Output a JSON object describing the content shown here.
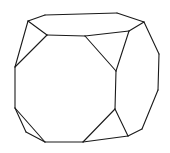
{
  "figure": {
    "stroke_color": "#1a1a1a",
    "stroke_width": 1.1,
    "background": "#ffffff",
    "vertices": {
      "A": [
        45,
        15
      ],
      "B": [
        117,
        13
      ],
      "C": [
        144,
        22
      ],
      "D": [
        28,
        21
      ],
      "E": [
        47,
        35
      ],
      "F": [
        85,
        36
      ],
      "G": [
        129,
        31
      ],
      "H": [
        15,
        67
      ],
      "I": [
        116,
        71
      ],
      "J": [
        159,
        54
      ],
      "K": [
        15,
        108
      ],
      "L": [
        115,
        109
      ],
      "M": [
        158,
        90
      ],
      "N": [
        26,
        132
      ],
      "O": [
        45,
        142
      ],
      "P": [
        83,
        142
      ],
      "Q": [
        128,
        136
      ],
      "R": [
        142,
        129
      ]
    },
    "edges": [
      [
        "D",
        "A"
      ],
      [
        "A",
        "B"
      ],
      [
        "B",
        "C"
      ],
      [
        "D",
        "E"
      ],
      [
        "E",
        "F"
      ],
      [
        "F",
        "G"
      ],
      [
        "G",
        "C"
      ],
      [
        "D",
        "H"
      ],
      [
        "E",
        "H"
      ],
      [
        "F",
        "I"
      ],
      [
        "G",
        "I"
      ],
      [
        "C",
        "J"
      ],
      [
        "J",
        "M"
      ],
      [
        "M",
        "R"
      ],
      [
        "H",
        "K"
      ],
      [
        "I",
        "L"
      ],
      [
        "K",
        "N"
      ],
      [
        "N",
        "O"
      ],
      [
        "K",
        "O"
      ],
      [
        "O",
        "P"
      ],
      [
        "P",
        "L"
      ],
      [
        "L",
        "Q"
      ],
      [
        "P",
        "Q"
      ],
      [
        "Q",
        "R"
      ]
    ]
  }
}
